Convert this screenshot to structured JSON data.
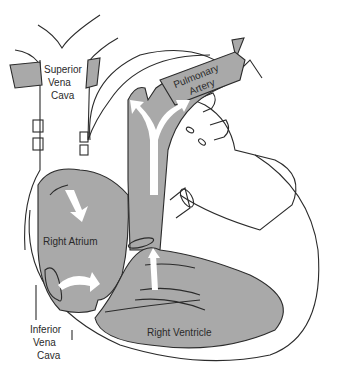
{
  "diagram": {
    "labels": {
      "superior_vena_cava": [
        "Superior",
        "Vena",
        "Cava"
      ],
      "pulmonary_artery": [
        "Pulmonary",
        "Artery"
      ],
      "right_atrium": "Right Atrium",
      "inferior_vena_cava": [
        "Inferior",
        "Vena",
        "Cava"
      ],
      "right_ventricle": "Right Ventricle"
    },
    "colors": {
      "chamber_fill": "#a9a9a9",
      "outline": "#2b2b2b",
      "flow_arrows": "#ffffff",
      "background": "#ffffff"
    }
  }
}
